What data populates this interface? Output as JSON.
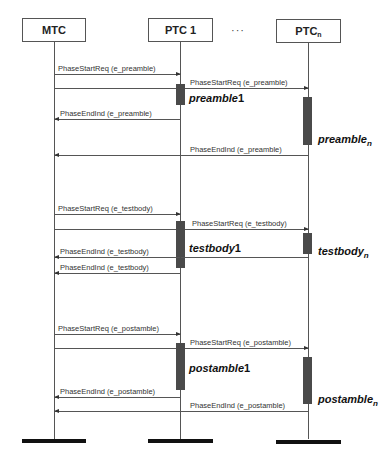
{
  "participants": [
    {
      "id": "mtc",
      "label": "MTC",
      "sub": ""
    },
    {
      "id": "ptc1",
      "label": "PTC 1",
      "sub": ""
    },
    {
      "id": "ptcn",
      "label": "PTC",
      "sub": "n"
    }
  ],
  "ellipsis": "···",
  "phases": {
    "preamble": {
      "start_req_mtc_ptc1": "PhaseStartReq (e_preamble)",
      "start_req_ptc1_ptcn": "PhaseStartReq (e_preamble)",
      "end_ind_ptc1_mtc": "PhaseEndInd (e_preamble)",
      "end_ind_ptcn_mtc": "PhaseEndInd (e_preamble)",
      "label_ptc1": "preamble",
      "label_ptc1_suffix": "1",
      "label_ptcn": "preamble",
      "label_ptcn_sub": "n"
    },
    "testbody": {
      "start_req_mtc_ptc1": "PhaseStartReq (e_testbody)",
      "start_req_ptc1_ptcn": "PhaseStartReq (e_testbody)",
      "end_ind_ptc1_mtc": "PhaseEndInd (e_testbody)",
      "end_ind_ptcn_mtc": "PhaseEndInd (e_testbody)",
      "label_ptc1": "testbody",
      "label_ptc1_suffix": "1",
      "label_ptcn": "testbody",
      "label_ptcn_sub": "n"
    },
    "postamble": {
      "start_req_mtc_ptc1": "PhaseStartReq (e_postamble)",
      "start_req_ptc1_ptcn": "PhaseStartReq (e_postamble)",
      "end_ind_ptc1_mtc": "PhaseEndInd (e_postamble)",
      "end_ind_ptcn_mtc": "PhaseEndInd (e_postamble)",
      "label_ptc1": "postamble",
      "label_ptc1_suffix": "1",
      "label_ptcn": "postamble",
      "label_ptcn_sub": "n"
    }
  }
}
